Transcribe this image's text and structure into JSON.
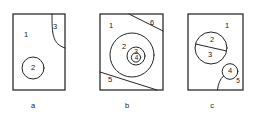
{
  "figure": {
    "background_color": "#ffffff",
    "line_color": "#262626",
    "panels": [
      {
        "caption": "a",
        "frame": {
          "x": 13,
          "y": 14,
          "width": 52,
          "height": 76
        },
        "region_labels": [
          {
            "text": "1",
            "x": 26,
            "y": 35
          },
          {
            "text": "2",
            "x": 33,
            "y": 68
          },
          {
            "text": "3",
            "x": 54,
            "y": 27
          }
        ],
        "shapes": [
          {
            "kind": "circle",
            "cx": 33,
            "cy": 68,
            "r": 11
          },
          {
            "kind": "corner-arc",
            "from_top_x": 52,
            "to_right_y": 48
          }
        ]
      },
      {
        "caption": "b",
        "frame": {
          "x": 100,
          "y": 14,
          "width": 63,
          "height": 76
        },
        "region_labels": [
          {
            "text": "1",
            "x": 111,
            "y": 26
          },
          {
            "text": "2",
            "x": 124,
            "y": 48
          },
          {
            "text": "3",
            "x": 135,
            "y": 52
          },
          {
            "text": "4",
            "x": 137,
            "y": 59
          },
          {
            "text": "5",
            "x": 110,
            "y": 80
          },
          {
            "text": "6",
            "x": 152,
            "y": 23
          }
        ],
        "shapes": [
          {
            "kind": "circle",
            "cx": 132,
            "cy": 55,
            "r": 22
          },
          {
            "kind": "circle",
            "cx": 136,
            "cy": 56,
            "r": 9
          },
          {
            "kind": "circle",
            "cx": 136,
            "cy": 57,
            "r": 5
          },
          {
            "kind": "chord",
            "x1": 129,
            "y1": 14,
            "x2": 163,
            "y2": 31
          },
          {
            "kind": "chord",
            "x1": 100,
            "y1": 72,
            "x2": 156,
            "y2": 90
          }
        ]
      },
      {
        "caption": "c",
        "frame": {
          "x": 188,
          "y": 14,
          "width": 55,
          "height": 76
        },
        "region_labels": [
          {
            "text": "1",
            "x": 227,
            "y": 26
          },
          {
            "text": "2",
            "x": 212,
            "y": 41
          },
          {
            "text": "3",
            "x": 210,
            "y": 54
          },
          {
            "text": "4",
            "x": 230,
            "y": 72
          },
          {
            "text": "5",
            "x": 238,
            "y": 81
          }
        ],
        "shapes": [
          {
            "kind": "circle",
            "cx": 211,
            "cy": 48,
            "r": 16
          },
          {
            "kind": "circle",
            "cx": 230,
            "cy": 72,
            "r": 8
          },
          {
            "kind": "chord",
            "x1": 196,
            "y1": 44,
            "x2": 227,
            "y2": 50
          },
          {
            "kind": "tail-curve",
            "x1": 222,
            "y1": 78,
            "x2": 218,
            "y2": 90
          }
        ]
      }
    ],
    "captions": [
      {
        "label": "a",
        "x": 33,
        "y": 108
      },
      {
        "label": "b",
        "x": 127,
        "y": 108
      },
      {
        "label": "c",
        "x": 212,
        "y": 108
      }
    ]
  }
}
